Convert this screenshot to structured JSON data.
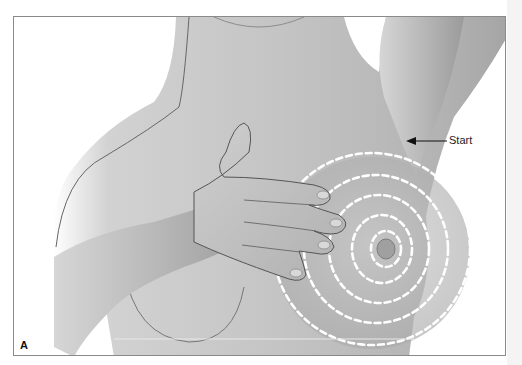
{
  "figure": {
    "top_caption": "(Paling ini ini ini)",
    "panel_label": "A",
    "annotations": [
      {
        "label": "Start",
        "target": "outermost-circle-top-right"
      }
    ],
    "pattern": {
      "type": "concentric-dashed-circles",
      "ring_count": 4,
      "color": "#ffffff"
    },
    "colors": {
      "skin": "#bdbdbd",
      "skin_shadow": "#9a9a9a",
      "outline": "#555555",
      "frame": "#8a8a8a",
      "background": "#ffffff"
    }
  }
}
